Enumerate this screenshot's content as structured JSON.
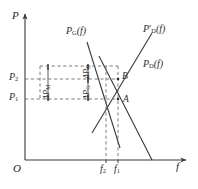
{
  "figure": {
    "type": "supply-demand-diagram",
    "axes": {
      "y_label": "P",
      "x_label": "f",
      "origin_label": "O"
    },
    "curves": [
      {
        "id": "pg",
        "label_main": "P",
        "label_sub": "G",
        "label_arg": "(f)",
        "prime": ""
      },
      {
        "id": "pd_prime",
        "label_main": "P",
        "label_sub": "D",
        "label_arg": "(f)",
        "prime": "′"
      },
      {
        "id": "pd",
        "label_main": "P",
        "label_sub": "D",
        "label_arg": "(f)",
        "prime": ""
      }
    ],
    "points": [
      {
        "id": "A",
        "label": "A"
      },
      {
        "id": "B",
        "label": "B"
      }
    ],
    "y_ticks": [
      {
        "main": "P",
        "sub": "2"
      },
      {
        "main": "P",
        "sub": "1"
      }
    ],
    "x_ticks": [
      {
        "main": "f",
        "sub": "2"
      },
      {
        "main": "f",
        "sub": "1"
      }
    ],
    "deltas": [
      {
        "id": "delta-pd",
        "main": "ΔP",
        "sub": "D"
      },
      {
        "id": "delta-pg",
        "main": "ΔP",
        "sub": "G"
      },
      {
        "id": "delta-pm",
        "main": "ΔP",
        "sub": "M"
      }
    ],
    "colors": {
      "stroke": "#3a3a3a",
      "dashed": "#6d6d6d",
      "text": "#2b2b2b",
      "background": "#ffffff"
    }
  }
}
